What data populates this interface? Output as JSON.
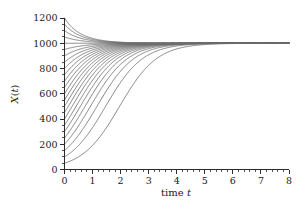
{
  "chart_data": {
    "type": "line",
    "title": "",
    "subtitle": "",
    "xlabel": "time t",
    "ylabel": "X(t)",
    "xlim": [
      0,
      8
    ],
    "ylim": [
      0,
      1200
    ],
    "xticks": [
      0,
      1,
      2,
      3,
      4,
      5,
      6,
      7,
      8
    ],
    "xtick_labels": [
      "0",
      "1",
      "2",
      "3",
      "4",
      "5",
      "6",
      "7",
      "8"
    ],
    "yticks": [
      0,
      200,
      400,
      600,
      800,
      1000,
      1200
    ],
    "ytick_labels": [
      "0",
      "200",
      "400",
      "600",
      "800",
      "1000",
      "1200"
    ],
    "x_minor_tick_step": 0.2,
    "y_minor_tick_step": 50,
    "grid": false,
    "legend": "none",
    "line_color": "#6e6e6e",
    "axis_color": "#2b2b2b",
    "background": "#ffffff",
    "carrying_capacity": 1000,
    "growth_rate": 1.5,
    "model": "X(t) = K / (1 + ((K - X0)/X0) * exp(-r t))",
    "initial_values": [
      50,
      100,
      150,
      200,
      250,
      300,
      350,
      400,
      450,
      500,
      550,
      600,
      650,
      700,
      750,
      800,
      850,
      900,
      950,
      1000,
      1050,
      1100,
      1150,
      1200
    ],
    "series": [
      {
        "name": "X0=50",
        "x0": 50
      },
      {
        "name": "X0=100",
        "x0": 100
      },
      {
        "name": "X0=150",
        "x0": 150
      },
      {
        "name": "X0=200",
        "x0": 200
      },
      {
        "name": "X0=250",
        "x0": 250
      },
      {
        "name": "X0=300",
        "x0": 300
      },
      {
        "name": "X0=350",
        "x0": 350
      },
      {
        "name": "X0=400",
        "x0": 400
      },
      {
        "name": "X0=450",
        "x0": 450
      },
      {
        "name": "X0=500",
        "x0": 500
      },
      {
        "name": "X0=550",
        "x0": 550
      },
      {
        "name": "X0=600",
        "x0": 600
      },
      {
        "name": "X0=650",
        "x0": 650
      },
      {
        "name": "X0=700",
        "x0": 700
      },
      {
        "name": "X0=750",
        "x0": 750
      },
      {
        "name": "X0=800",
        "x0": 800
      },
      {
        "name": "X0=850",
        "x0": 850
      },
      {
        "name": "X0=900",
        "x0": 900
      },
      {
        "name": "X0=950",
        "x0": 950
      },
      {
        "name": "X0=1000",
        "x0": 1000
      },
      {
        "name": "X0=1050",
        "x0": 1050
      },
      {
        "name": "X0=1100",
        "x0": 1100
      },
      {
        "name": "X0=1150",
        "x0": 1150
      },
      {
        "name": "X0=1200",
        "x0": 1200
      }
    ]
  },
  "figure": {
    "xlabel_prefix": "time ",
    "xlabel_italic": "t",
    "ylabel_prefix": "X",
    "ylabel_paren_open": "(",
    "ylabel_italic": "t",
    "ylabel_paren_close": ")"
  }
}
